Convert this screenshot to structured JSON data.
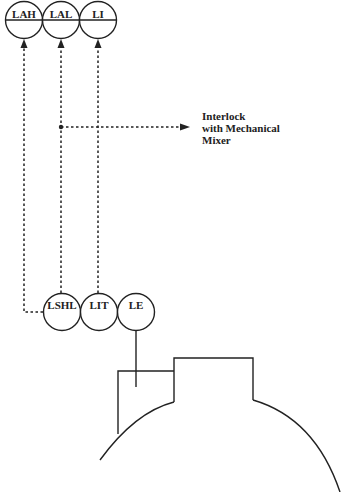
{
  "diagram": {
    "alarm_instruments": [
      {
        "tag": "LAH",
        "cx": 24,
        "cy": 20
      },
      {
        "tag": "LAL",
        "cx": 61,
        "cy": 20
      },
      {
        "tag": "LI",
        "cx": 98,
        "cy": 20
      }
    ],
    "field_instruments": [
      {
        "tag": "LSHL",
        "cx": 62,
        "cy": 312
      },
      {
        "tag": "LIT",
        "cx": 99,
        "cy": 312
      },
      {
        "tag": "LE",
        "cx": 136,
        "cy": 312
      }
    ],
    "interlock_note": {
      "line1": "Interlock",
      "line2": "with Mechanical",
      "line3": "Mixer"
    },
    "line_color": "#222222"
  }
}
